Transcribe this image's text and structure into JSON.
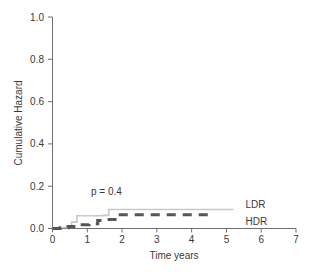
{
  "chart_data": {
    "type": "line",
    "title": "",
    "xlabel": "Time years",
    "ylabel": "Cumulative Hazard",
    "xlim": [
      0,
      7
    ],
    "ylim": [
      0,
      1.0
    ],
    "xticks": [
      "0",
      "1",
      "2",
      "3",
      "4",
      "5",
      "6",
      "7"
    ],
    "xtick_values": [
      0,
      1,
      2,
      3,
      4,
      5,
      6,
      7
    ],
    "yticks": [
      "0.0",
      "0.2",
      "0.4",
      "0.6",
      "0.8",
      "1.0"
    ],
    "ytick_values": [
      0.0,
      0.2,
      0.4,
      0.6,
      0.8,
      1.0
    ],
    "grid": false,
    "legend_position": "right-inline",
    "annotations": [
      {
        "text": "p = 0.4",
        "x": 1.55,
        "y": 0.175
      }
    ],
    "series": [
      {
        "name": "LDR",
        "style": "solid",
        "color": "#c8c8c8",
        "label_x": 5.55,
        "label_y": 0.115,
        "step": "post",
        "x": [
          0.0,
          0.18,
          0.42,
          0.55,
          0.7,
          1.0,
          1.45,
          1.62,
          2.3,
          3.1,
          4.0,
          5.2
        ],
        "y": [
          0.0,
          0.005,
          0.012,
          0.03,
          0.06,
          0.06,
          0.062,
          0.09,
          0.09,
          0.09,
          0.09,
          0.09
        ]
      },
      {
        "name": "HDR",
        "style": "dashed",
        "color": "#555555",
        "label_x": 5.55,
        "label_y": 0.032,
        "step": "post",
        "x": [
          0.0,
          0.22,
          0.45,
          0.75,
          1.05,
          1.3,
          1.55,
          1.8,
          4.55
        ],
        "y": [
          0.0,
          0.003,
          0.01,
          0.018,
          0.022,
          0.038,
          0.042,
          0.065,
          0.065
        ]
      }
    ]
  },
  "axes": {
    "x_axis_name": "x-axis",
    "y_axis_name": "y-axis"
  }
}
